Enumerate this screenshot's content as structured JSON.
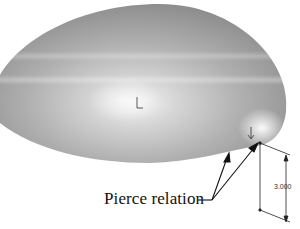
{
  "diagram": {
    "type": "cad-model-annotation",
    "colors": {
      "surface_dark": "#8e8e8e",
      "surface_mid": "#b4b4b4",
      "surface_highlight": "#f4f4f4",
      "line": "#111111",
      "background": "#ffffff"
    },
    "callout": {
      "label": "Pierce relation",
      "arrow_count": 2
    },
    "dimension": {
      "value": "3.000",
      "orientation": "vertical"
    },
    "markers": [
      {
        "name": "origin-marker-center",
        "glyph": "origin-triad"
      },
      {
        "name": "origin-marker-edge",
        "glyph": "origin-triad"
      }
    ]
  }
}
